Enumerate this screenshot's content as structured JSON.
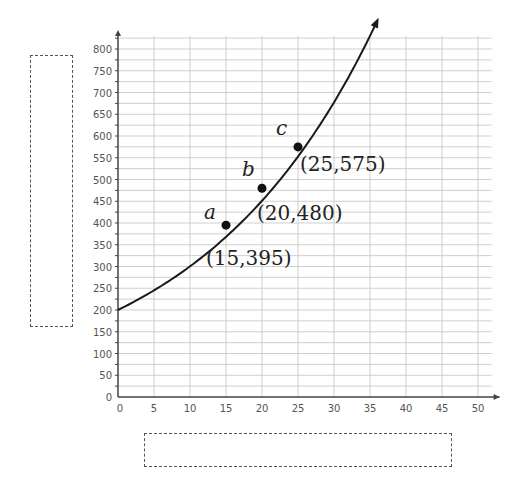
{
  "chart_data": {
    "type": "line",
    "title": "",
    "xlabel": "",
    "ylabel": "",
    "xlim": [
      0,
      50
    ],
    "ylim": [
      0,
      800
    ],
    "x_ticks": [
      0,
      5,
      10,
      15,
      20,
      25,
      30,
      35,
      40,
      45,
      50
    ],
    "y_ticks": [
      0,
      50,
      100,
      150,
      200,
      250,
      300,
      350,
      400,
      450,
      500,
      550,
      600,
      650,
      700,
      750,
      800
    ],
    "grid": true,
    "series": [
      {
        "name": "curve",
        "description": "increasing exponential-like curve starting at (0,200), arrow at end",
        "x": [
          0,
          5,
          10,
          15,
          20,
          25,
          30,
          35
        ],
        "values": [
          200,
          255,
          320,
          395,
          480,
          575,
          690,
          830
        ]
      }
    ],
    "points": [
      {
        "label": "a",
        "x": 15,
        "y": 395,
        "annotation": "(15,395)"
      },
      {
        "label": "b",
        "x": 20,
        "y": 480,
        "annotation": "(20,480)"
      },
      {
        "label": "c",
        "x": 25,
        "y": 575,
        "annotation": "(25,575)"
      }
    ],
    "blank_boxes": [
      {
        "role": "y-axis label placeholder",
        "orientation": "vertical"
      },
      {
        "role": "x-axis label placeholder",
        "orientation": "horizontal"
      }
    ]
  },
  "labels": {
    "a": "a",
    "b": "b",
    "c": "c",
    "pa": "(15,395)",
    "pb": "(20,480)",
    "pc": "(25,575)"
  }
}
